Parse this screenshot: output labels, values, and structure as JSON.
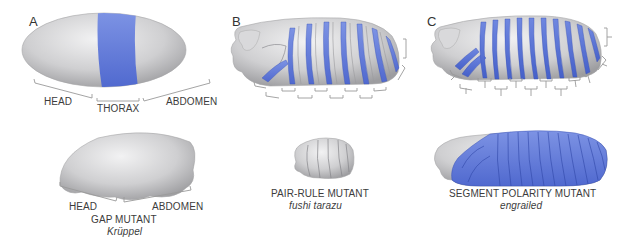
{
  "figure": {
    "panels": [
      {
        "letter": "A",
        "wild_type_regions": [
          "HEAD",
          "THORAX",
          "ABDOMEN"
        ],
        "mutant": {
          "class": "GAP MUTANT",
          "gene": "Krüppel",
          "regions": [
            "HEAD",
            "ABDOMEN"
          ]
        }
      },
      {
        "letter": "B",
        "mutant": {
          "class": "PAIR-RULE MUTANT",
          "gene": "fushi tarazu"
        }
      },
      {
        "letter": "C",
        "mutant": {
          "class": "SEGMENT POLARITY MUTANT",
          "gene": "engrailed"
        }
      }
    ],
    "colors": {
      "embryo_gray": "#c9c9cb",
      "embryo_light": "#ebebec",
      "expression_blue": "#5b78d6",
      "bracket_gray": "#9a9a9a",
      "text": "#3a3a3a"
    }
  }
}
